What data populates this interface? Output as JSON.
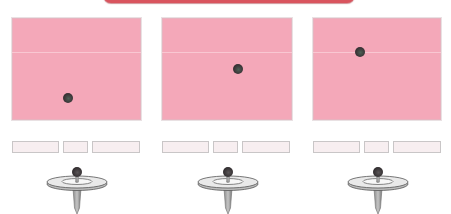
{
  "diagram": {
    "colors": {
      "top_bar": "#d9545e",
      "panel_fill": "#f4a8b9",
      "panel_line": "#f9c7d2",
      "ball": "#3b3638",
      "box_fill": "#f7eef0",
      "box_border": "#c9c6c7",
      "stand_disc": "#e9e9e9",
      "stand_stem": "#a9a9a9"
    },
    "panels": [
      {
        "id": "panel-1",
        "x": 12,
        "width": 129,
        "ball": {
          "x": 56,
          "y": 80
        },
        "line_y": 34
      },
      {
        "id": "panel-2",
        "x": 162,
        "width": 130,
        "ball": {
          "x": 76,
          "y": 51
        },
        "line_y": 34
      },
      {
        "id": "panel-3",
        "x": 313,
        "width": 128,
        "ball": {
          "x": 47,
          "y": 34
        },
        "line_y": 34
      }
    ],
    "box_rows": [
      {
        "x": 12,
        "boxes": [
          {
            "x": 0,
            "w": 47,
            "text": ""
          },
          {
            "x": 51,
            "w": 25,
            "text": ""
          },
          {
            "x": 80,
            "w": 48,
            "text": ""
          }
        ]
      },
      {
        "x": 162,
        "boxes": [
          {
            "x": 0,
            "w": 47,
            "text": ""
          },
          {
            "x": 51,
            "w": 25,
            "text": ""
          },
          {
            "x": 80,
            "w": 48,
            "text": ""
          }
        ]
      },
      {
        "x": 313,
        "boxes": [
          {
            "x": 0,
            "w": 47,
            "text": ""
          },
          {
            "x": 51,
            "w": 25,
            "text": ""
          },
          {
            "x": 80,
            "w": 48,
            "text": ""
          }
        ]
      }
    ],
    "stands": [
      {
        "id": "stand-1",
        "center_x": 77
      },
      {
        "id": "stand-2",
        "center_x": 228
      },
      {
        "id": "stand-3",
        "center_x": 378
      }
    ]
  }
}
